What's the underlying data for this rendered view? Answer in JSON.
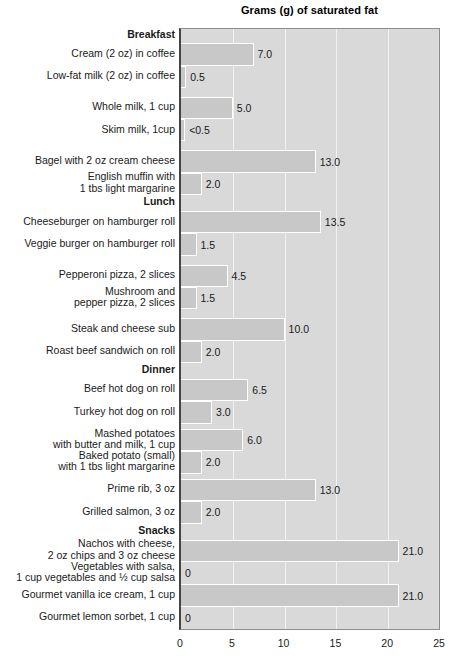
{
  "chart_data": {
    "type": "bar",
    "orientation": "horizontal",
    "title": "Grams (g) of saturated fat",
    "xlabel": "",
    "ylabel": "",
    "xlim": [
      0,
      25
    ],
    "xticks": [
      "0",
      "5",
      "10",
      "15",
      "20",
      "25"
    ],
    "grid": true,
    "legend": "none",
    "categories": [
      "Breakfast",
      "Cream (2 oz) in coffee",
      "Low-fat milk (2 oz) in coffee",
      "Whole milk, 1 cup",
      "Skim milk, 1cup",
      "Bagel with 2 oz cream cheese",
      "English muffin with 1 tbs light margarine",
      "Lunch",
      "Cheeseburger on hamburger roll",
      "Veggie burger on hamburger roll",
      "Pepperoni pizza, 2 slices",
      "Mushroom and pepper pizza, 2 slices",
      "Steak and cheese sub",
      "Roast beef sandwich on roll",
      "Dinner",
      "Beef hot dog on roll",
      "Turkey hot dog on roll",
      "Mashed potatoes with butter and milk, 1 cup",
      "Baked potato (small) with 1 tbs light margarine",
      "Prime rib, 3 oz",
      "Grilled salmon, 3 oz",
      "Snacks",
      "Nachos with cheese, 2 oz chips and 3 oz cheese",
      "Vegetables with salsa, 1 cup vegetables and ½ cup salsa",
      "Gourmet vanilla ice cream, 1 cup",
      "Gourmet lemon sorbet, 1 cup"
    ],
    "values": [
      null,
      7.0,
      0.5,
      5.0,
      0.4,
      13.0,
      2.0,
      null,
      13.5,
      1.5,
      4.5,
      1.5,
      10.0,
      2.0,
      null,
      6.5,
      3.0,
      6.0,
      2.0,
      13.0,
      2.0,
      null,
      21.0,
      0,
      21.0,
      0
    ],
    "value_labels": [
      null,
      "7.0",
      "0.5",
      "5.0",
      "<0.5",
      "13.0",
      "2.0",
      null,
      "13.5",
      "1.5",
      "4.5",
      "1.5",
      "10.0",
      "2.0",
      null,
      "6.5",
      "3.0",
      "6.0",
      "2.0",
      "13.0",
      "2.0",
      null,
      "21.0",
      "0",
      "21.0",
      "0"
    ]
  },
  "rows": [
    {
      "kind": "group",
      "lines": [
        "Breakfast"
      ],
      "value": null,
      "value_label": null,
      "top": 0,
      "height": 16
    },
    {
      "kind": "bar",
      "lines": [
        "Cream (2 oz) in coffee"
      ],
      "value": 7.0,
      "value_label": "7.0",
      "top": 16,
      "height": 25
    },
    {
      "kind": "bar",
      "lines": [
        "Low-fat milk (2 oz) in coffee"
      ],
      "value": 0.5,
      "value_label": "0.5",
      "top": 41,
      "height": 25
    },
    {
      "kind": "spacer",
      "lines": [],
      "value": null,
      "value_label": null,
      "top": 66,
      "height": 10
    },
    {
      "kind": "bar",
      "lines": [
        "Whole milk, 1 cup"
      ],
      "value": 5.0,
      "value_label": "5.0",
      "top": 76,
      "height": 25
    },
    {
      "kind": "bar",
      "lines": [
        "Skim milk, 1cup"
      ],
      "value": 0.4,
      "value_label": "<0.5",
      "top": 101,
      "height": 25
    },
    {
      "kind": "spacer",
      "lines": [],
      "value": null,
      "value_label": null,
      "top": 126,
      "height": 10
    },
    {
      "kind": "bar",
      "lines": [
        "Bagel with 2 oz cream cheese"
      ],
      "value": 13.0,
      "value_label": "13.0",
      "top": 136,
      "height": 25
    },
    {
      "kind": "bar",
      "lines": [
        "English muffin with",
        "1 tbs light margarine"
      ],
      "value": 2.0,
      "value_label": "2.0",
      "top": 161,
      "height": 25
    },
    {
      "kind": "group",
      "lines": [
        "Lunch"
      ],
      "value": null,
      "value_label": null,
      "top": 186,
      "height": 18
    },
    {
      "kind": "bar",
      "lines": [
        "Cheeseburger on hamburger roll"
      ],
      "value": 13.5,
      "value_label": "13.5",
      "top": 204,
      "height": 25
    },
    {
      "kind": "bar",
      "lines": [
        "Veggie burger on hamburger roll"
      ],
      "value": 1.5,
      "value_label": "1.5",
      "top": 229,
      "height": 25
    },
    {
      "kind": "spacer",
      "lines": [],
      "value": null,
      "value_label": null,
      "top": 254,
      "height": 10
    },
    {
      "kind": "bar",
      "lines": [
        "Pepperoni pizza, 2 slices"
      ],
      "value": 4.5,
      "value_label": "4.5",
      "top": 264,
      "height": 25
    },
    {
      "kind": "bar",
      "lines": [
        "Mushroom and",
        "pepper pizza, 2 slices"
      ],
      "value": 1.5,
      "value_label": "1.5",
      "top": 289,
      "height": 25
    },
    {
      "kind": "spacer",
      "lines": [],
      "value": null,
      "value_label": null,
      "top": 314,
      "height": 10
    },
    {
      "kind": "bar",
      "lines": [
        "Steak and cheese sub"
      ],
      "value": 10.0,
      "value_label": "10.0",
      "top": 324,
      "height": 25
    },
    {
      "kind": "bar",
      "lines": [
        "Roast beef sandwich on roll"
      ],
      "value": 2.0,
      "value_label": "2.0",
      "top": 349,
      "height": 25
    },
    {
      "kind": "group",
      "lines": [
        "Dinner"
      ],
      "value": null,
      "value_label": null,
      "top": 374,
      "height": 18
    },
    {
      "kind": "bar",
      "lines": [
        "Beef hot dog on roll"
      ],
      "value": 6.5,
      "value_label": "6.5",
      "top": 392,
      "height": 25
    },
    {
      "kind": "bar",
      "lines": [
        "Turkey hot dog on roll"
      ],
      "value": 3.0,
      "value_label": "3.0",
      "top": 417,
      "height": 25
    },
    {
      "kind": "spacer",
      "lines": [],
      "value": null,
      "value_label": null,
      "top": 442,
      "height": 6
    },
    {
      "kind": "bar",
      "lines": [
        "Mashed potatoes",
        "with butter and milk, 1 cup"
      ],
      "value": 6.0,
      "value_label": "6.0",
      "top": 448,
      "height": 25
    },
    {
      "kind": "bar",
      "lines": [
        "Baked potato (small)",
        "with 1 tbs light margarine"
      ],
      "value": 2.0,
      "value_label": "2.0",
      "top": 473,
      "height": 25
    },
    {
      "kind": "spacer",
      "lines": [],
      "value": null,
      "value_label": null,
      "top": 498,
      "height": 6
    },
    {
      "kind": "bar",
      "lines": [
        "Prime rib, 3 oz"
      ],
      "value": 13.0,
      "value_label": "13.0",
      "top": 504,
      "height": 25
    },
    {
      "kind": "bar",
      "lines": [
        "Grilled salmon, 3 oz"
      ],
      "value": 2.0,
      "value_label": "2.0",
      "top": 529,
      "height": 25
    },
    {
      "kind": "group",
      "lines": [
        "Snacks"
      ],
      "value": null,
      "value_label": null,
      "top": 554,
      "height": 18
    },
    {
      "kind": "bar",
      "lines": [
        "Nachos with cheese,",
        "2 oz chips and 3 oz cheese"
      ],
      "value": 21.0,
      "value_label": "21.0",
      "top": 572,
      "height": 25
    },
    {
      "kind": "bar",
      "lines": [
        "Vegetables with salsa,",
        "1 cup vegetables and ½ cup salsa"
      ],
      "value": 0,
      "value_label": "0",
      "top": 597,
      "height": 25
    },
    {
      "kind": "bar",
      "lines": [
        "Gourmet vanilla ice cream, 1 cup"
      ],
      "value": 21.0,
      "value_label": "21.0",
      "top": 622,
      "height": 25
    },
    {
      "kind": "bar",
      "lines": [
        "Gourmet lemon sorbet, 1 cup"
      ],
      "value": 0,
      "value_label": "0",
      "top": 647,
      "height": 25
    }
  ],
  "colors": {
    "bar_fill": "#c8c8c8",
    "bar_border": "#ffffff",
    "plot_background": "#d9d9d9",
    "gridline": "#f2f2f2",
    "axis": "#444444",
    "text": "#1a1a1a"
  }
}
